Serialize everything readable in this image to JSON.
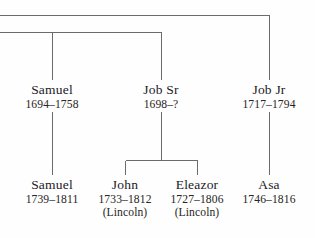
{
  "diagram": {
    "kind": "genealogy-family-tree",
    "line_color": "#6b6b6b",
    "text_color": "#22201f",
    "background": "#fefefe"
  },
  "generations": {
    "parents": [
      {
        "id": "samuel-1694",
        "name": "Samuel",
        "dates": "1694–1758",
        "note": "",
        "x": 52
      },
      {
        "id": "job-sr",
        "name": "Job Sr",
        "dates": "1698–?",
        "note": "",
        "x": 161
      },
      {
        "id": "job-jr",
        "name": "Job Jr",
        "dates": "1717–1794",
        "note": "",
        "x": 269
      }
    ],
    "children": [
      {
        "id": "samuel-1739",
        "name": "Samuel",
        "dates": "1739–1811",
        "note": "",
        "x": 52
      },
      {
        "id": "john-1733",
        "name": "John",
        "dates": "1733–1812",
        "note": "(Lincoln)",
        "x": 125
      },
      {
        "id": "eleazor-1727",
        "name": "Eleazor",
        "dates": "1727–1806",
        "note": "(Lincoln)",
        "x": 197
      },
      {
        "id": "asa-1746",
        "name": "Asa",
        "dates": "1746–1816",
        "note": "",
        "x": 269
      }
    ]
  }
}
